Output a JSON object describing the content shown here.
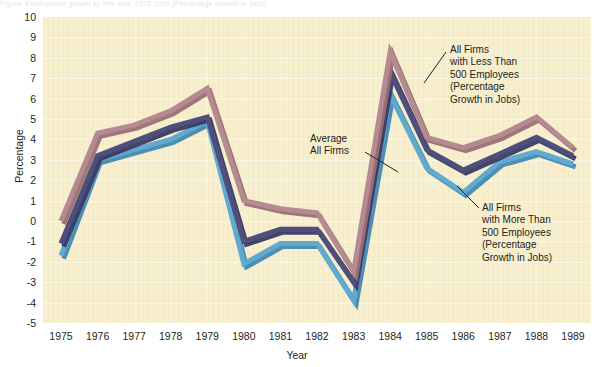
{
  "caption": "Figure: Employment growth by firm size, 1975-1989 (Percentage Growth in Jobs)",
  "axes": {
    "ylabel": "Percentage",
    "xlabel": "Year",
    "yticks": [
      "10",
      "9",
      "8",
      "7",
      "6",
      "5",
      "4",
      "3",
      "2",
      "1",
      "0",
      "-1",
      "-2",
      "-3",
      "-4",
      "-5"
    ],
    "xticks": [
      "1975",
      "1976",
      "1977",
      "1978",
      "1979",
      "1980",
      "1981",
      "1982",
      "1983",
      "1984",
      "1985",
      "1986",
      "1987",
      "1988",
      "1989"
    ]
  },
  "annotations": [
    {
      "name": "small-firms",
      "text": "All Firms\nwith Less Than\n500 Employees\n(Percentage\nGrowth in Jobs)"
    },
    {
      "name": "average-firms",
      "text": "Average\nAll Firms"
    },
    {
      "name": "large-firms",
      "text": "All Firms\nwith More Than\n500 Employees\n(Percentage\nGrowth in Jobs)"
    }
  ],
  "colors": {
    "background": "#f7eecb",
    "small_firms": "#b58a90",
    "small_firms_shadow": "#9a6f76",
    "average": "#4f4f7e",
    "average_shadow": "#3a3a63",
    "large_firms": "#61a9cf",
    "large_firms_shadow": "#4389b1",
    "text": "#231f20"
  },
  "chart_data": {
    "type": "line",
    "title": "",
    "xlabel": "Year",
    "ylabel": "Percentage",
    "x": [
      1975,
      1976,
      1977,
      1978,
      1979,
      1980,
      1981,
      1982,
      1983,
      1984,
      1985,
      1986,
      1987,
      1988,
      1989
    ],
    "xlim": [
      1975,
      1989
    ],
    "ylim": [
      -5,
      10
    ],
    "ytick_step": 1,
    "grid": true,
    "legend": "annotations-inline",
    "series": [
      {
        "name": "All Firms with Less Than 500 Employees (Percentage Growth in Jobs)",
        "color": "#b58a90",
        "values": [
          0.0,
          4.3,
          4.7,
          5.4,
          6.5,
          1.0,
          0.6,
          0.4,
          -2.5,
          8.3,
          4.1,
          3.6,
          4.2,
          5.1,
          3.6
        ]
      },
      {
        "name": "Average All Firms",
        "color": "#4f4f7e",
        "values": [
          -1.1,
          3.2,
          3.9,
          4.6,
          5.1,
          -1.0,
          -0.4,
          -0.4,
          -3.0,
          7.3,
          3.5,
          2.5,
          3.3,
          4.1,
          3.2
        ]
      },
      {
        "name": "All Firms with More Than 500 Employees (Percentage Growth in Jobs)",
        "color": "#61a9cf",
        "values": [
          -1.7,
          3.0,
          3.5,
          4.0,
          4.9,
          -2.1,
          -1.1,
          -1.1,
          -3.9,
          6.2,
          2.6,
          1.4,
          2.9,
          3.4,
          2.8
        ]
      }
    ]
  }
}
